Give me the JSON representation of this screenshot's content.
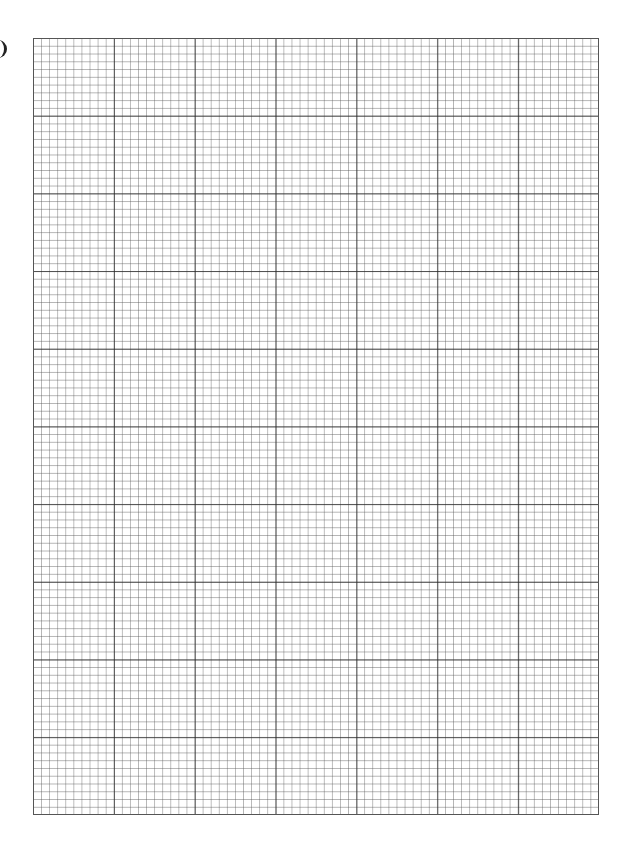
{
  "page": {
    "type": "graph paper",
    "grid": {
      "major_columns": 7,
      "major_rows": 10,
      "minor_per_major": 10,
      "line_color": "#333333"
    }
  }
}
